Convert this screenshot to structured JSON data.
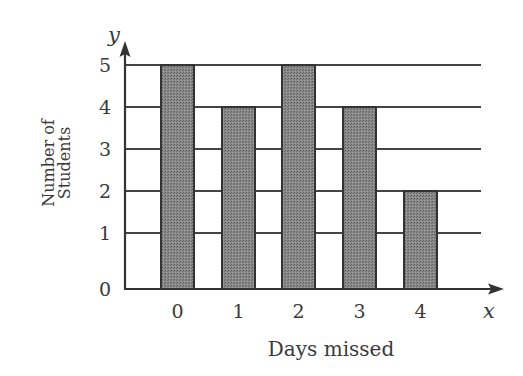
{
  "chart_data": {
    "type": "bar",
    "title": "",
    "xlabel": "Days missed",
    "ylabel": "Number of Students",
    "ylabel_lines": [
      "Number of",
      "Students"
    ],
    "x_axis_variable": "x",
    "y_axis_variable": "y",
    "categories": [
      "0",
      "1",
      "2",
      "3",
      "4"
    ],
    "values": [
      5,
      4,
      5,
      4,
      2
    ],
    "y_ticks": [
      "0",
      "1",
      "2",
      "3",
      "4",
      "5"
    ],
    "ylim": [
      0,
      5
    ],
    "grid": true,
    "legend": null,
    "colors": {
      "bar_fill": "#7d7d7d",
      "bar_stroke": "#333333",
      "grid": "#444444",
      "axis": "#333333",
      "text": "#3a3a3a"
    }
  }
}
